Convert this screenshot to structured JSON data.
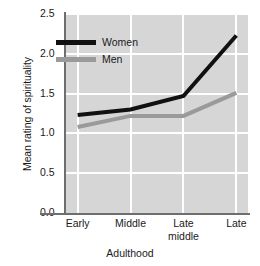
{
  "chart_data": {
    "type": "line",
    "title": "",
    "xlabel": "Adulthood",
    "ylabel": "Mean rating of spirituality",
    "categories": [
      "Early",
      "Middle",
      "Late middle",
      "Late"
    ],
    "category_lines": [
      [
        "Early"
      ],
      [
        "Middle"
      ],
      [
        "Late",
        "middle"
      ],
      [
        "Late"
      ]
    ],
    "x": [
      0,
      1,
      2,
      3
    ],
    "xlim": [
      -0.22,
      3.22
    ],
    "ylim": [
      0.0,
      2.5
    ],
    "yticks": [
      "0.0",
      "0.5",
      "1.0",
      "1.5",
      "2.0",
      "2.5"
    ],
    "ytick_values": [
      0.0,
      0.5,
      1.0,
      1.5,
      2.0,
      2.5
    ],
    "grid": true,
    "grid_color": "#ffffff",
    "plot_background": "#d6d6d6",
    "legend_position": "upper left",
    "series": [
      {
        "name": "Women",
        "color": "#111111",
        "line_width": 4,
        "values": [
          1.23,
          1.3,
          1.47,
          2.23
        ]
      },
      {
        "name": "Men",
        "color": "#9a9a9a",
        "line_width": 4,
        "values": [
          1.08,
          1.22,
          1.22,
          1.51
        ]
      }
    ]
  },
  "legend": {
    "items": [
      {
        "label": "Women",
        "color": "#111111"
      },
      {
        "label": "Men",
        "color": "#9a9a9a"
      }
    ]
  },
  "axes": {
    "y_title": "Mean rating of spirituality",
    "x_title": "Adulthood",
    "spine_color": "#6e6e6e"
  }
}
